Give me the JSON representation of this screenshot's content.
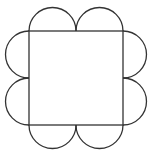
{
  "diagram": {
    "stroke_color": "#333333",
    "background": "#ffffff",
    "square": {
      "x": 29,
      "y": 31,
      "size": 94
    },
    "semicircle_radius": 23.5,
    "semicircles_per_side": 2,
    "sides": [
      "top",
      "right",
      "bottom",
      "left"
    ]
  }
}
